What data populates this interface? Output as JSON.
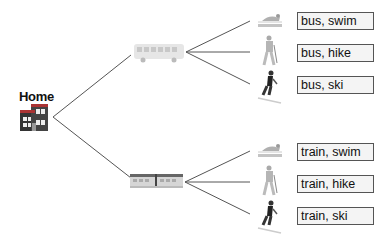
{
  "root": {
    "label": "Home",
    "icon": "house-icon"
  },
  "branches": [
    {
      "mode": "bus",
      "icon": "bus-icon",
      "leaves": [
        {
          "activity": "swim",
          "icon": "swimmer-icon",
          "label": "bus, swim"
        },
        {
          "activity": "hike",
          "icon": "hiker-icon",
          "label": "bus, hike"
        },
        {
          "activity": "ski",
          "icon": "skier-icon",
          "label": "bus, ski"
        }
      ]
    },
    {
      "mode": "train",
      "icon": "train-icon",
      "leaves": [
        {
          "activity": "swim",
          "icon": "swimmer-icon",
          "label": "train, swim"
        },
        {
          "activity": "hike",
          "icon": "hiker-icon",
          "label": "train, hike"
        },
        {
          "activity": "ski",
          "icon": "skier-icon",
          "label": "train, ski"
        }
      ]
    }
  ],
  "colors": {
    "line": "#555555",
    "box_border": "#555555",
    "box_fill": "#f4f4f4"
  }
}
